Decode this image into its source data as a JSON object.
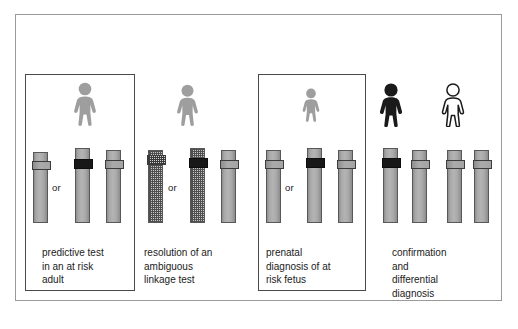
{
  "figure": {
    "background_color": "#ffffff",
    "outer_frame_color": "#9a9a9a",
    "panel_border_color": "#4a4a4a"
  },
  "colors": {
    "lane_gray": "#a8a8a8",
    "band_gray": "#a4a4a4",
    "band_black": "#181818",
    "figure_gray": "#9e9e9e",
    "figure_black": "#1a1a1a",
    "figure_white_outline": "#1a1a1a",
    "text": "#1b1b1b"
  },
  "panels": [
    {
      "id": "panel-1",
      "boxed": true,
      "caption": "predictive test\nin an at risk\nadult",
      "or_label": "or",
      "figure": {
        "name": "adult-figure-gray",
        "style": "gray-filled",
        "size": "adult"
      },
      "lanes": [
        {
          "id": "p1-lane-1",
          "texture": "plain",
          "band": "gray"
        },
        {
          "id": "p1-lane-2",
          "texture": "plain",
          "band": "black"
        },
        {
          "id": "p1-lane-3",
          "texture": "plain",
          "band": "gray"
        }
      ]
    },
    {
      "id": "panel-2",
      "boxed": false,
      "caption": "resolution of an\nambiguous\nlinkage test",
      "or_label": "or",
      "figure": {
        "name": "adult-figure-gray",
        "style": "gray-filled",
        "size": "adult"
      },
      "lanes": [
        {
          "id": "p2-lane-1",
          "texture": "hatched",
          "band": "hatched"
        },
        {
          "id": "p2-lane-2",
          "texture": "hatched",
          "band": "black"
        },
        {
          "id": "p2-lane-3",
          "texture": "plain",
          "band": "gray"
        }
      ]
    },
    {
      "id": "panel-3",
      "boxed": true,
      "caption": "prenatal\ndiagnosis of at\nrisk fetus",
      "or_label": "or",
      "figure": {
        "name": "fetus-figure-gray",
        "style": "gray-filled",
        "size": "small"
      },
      "lanes": [
        {
          "id": "p3-lane-1",
          "texture": "plain",
          "band": "gray"
        },
        {
          "id": "p3-lane-2",
          "texture": "plain",
          "band": "black"
        },
        {
          "id": "p3-lane-3",
          "texture": "plain",
          "band": "gray"
        }
      ]
    },
    {
      "id": "panel-4",
      "boxed": false,
      "caption": "confirmation\nand\ndifferential\ndiagnosis",
      "or_label": "",
      "figures": [
        {
          "name": "affected-figure-black",
          "style": "black-filled",
          "size": "adult"
        },
        {
          "name": "unaffected-figure-white",
          "style": "white-outline",
          "size": "adult"
        }
      ],
      "lanes": [
        {
          "id": "p4-lane-1",
          "texture": "plain",
          "band": "black"
        },
        {
          "id": "p4-lane-2",
          "texture": "plain",
          "band": "gray"
        },
        {
          "id": "p4-lane-3",
          "texture": "plain",
          "band": "gray"
        },
        {
          "id": "p4-lane-4",
          "texture": "plain",
          "band": "gray"
        }
      ]
    }
  ]
}
